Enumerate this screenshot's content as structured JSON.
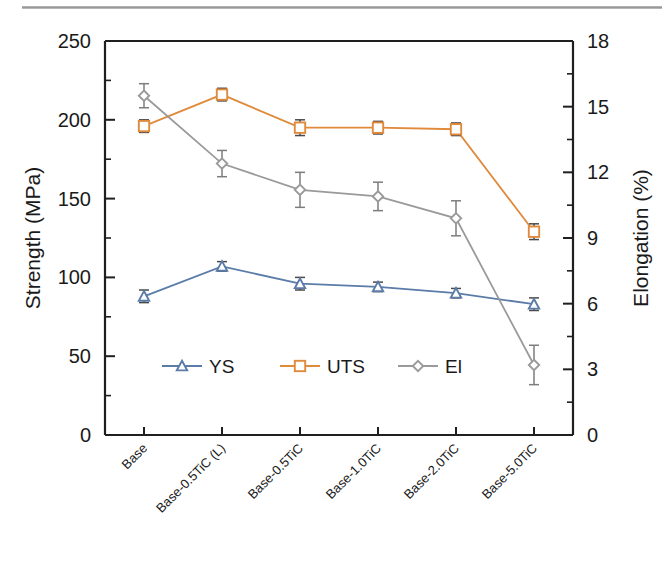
{
  "figure": {
    "kind": "scientific-line-chart",
    "background": "#ffffff"
  },
  "chart_data": {
    "type": "line",
    "title": "",
    "xlabel": "",
    "ylabel": "Strength (MPa)",
    "y2label": "Elongation (%)",
    "categories": [
      "Base",
      "Base-0.5TiC (L)",
      "Base-0.5TiC",
      "Base-1.0TiC",
      "Base-2.0TiC",
      "Base-5.0TiC"
    ],
    "ylim": [
      0,
      250
    ],
    "y2lim": [
      0,
      18
    ],
    "yticks": [
      0,
      50,
      100,
      150,
      200,
      250
    ],
    "y2ticks": [
      0,
      3,
      6,
      9,
      12,
      15,
      18
    ],
    "yticklabels": [
      "0",
      "50",
      "100",
      "150",
      "200",
      "250"
    ],
    "y2ticklabels": [
      "0",
      "3",
      "6",
      "9",
      "12",
      "15",
      "18"
    ],
    "y_minor_step": 25,
    "y2_minor_step": 1.5,
    "grid": false,
    "legend_position": "lower-center-inside",
    "series": [
      {
        "name": "YS",
        "axis": "left",
        "unit": "MPa",
        "color": "#5b7ca8",
        "marker": "triangle",
        "values": [
          88,
          107,
          96,
          94,
          90,
          83
        ],
        "errors": [
          4,
          3,
          4,
          3,
          3,
          4
        ]
      },
      {
        "name": "UTS",
        "axis": "left",
        "unit": "MPa",
        "color": "#e08a3c",
        "marker": "square",
        "values": [
          196,
          216,
          195,
          195,
          194,
          129
        ],
        "errors": [
          4,
          4,
          5,
          4,
          4,
          5
        ]
      },
      {
        "name": "El",
        "axis": "right",
        "unit": "%",
        "color": "#9a9a9a",
        "marker": "diamond",
        "values": [
          15.5,
          12.4,
          11.2,
          10.9,
          9.9,
          3.2
        ],
        "errors": [
          0.55,
          0.6,
          0.8,
          0.65,
          0.8,
          0.9
        ]
      }
    ]
  },
  "legend": {
    "entries": [
      {
        "label": "YS"
      },
      {
        "label": "UTS"
      },
      {
        "label": "El"
      }
    ]
  }
}
